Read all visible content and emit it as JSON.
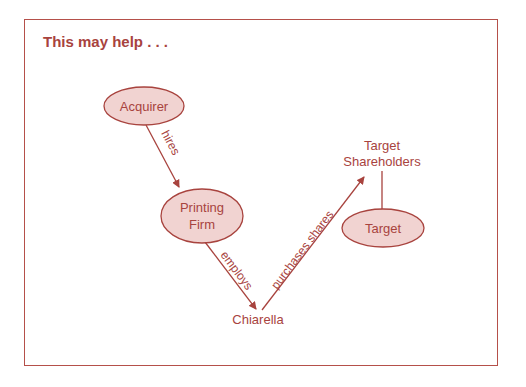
{
  "title": "This may help . . .",
  "colors": {
    "stroke": "#a8433e",
    "fill": "#f1d3d1",
    "frame": "#b5504a"
  },
  "nodes": {
    "acquirer": "Acquirer",
    "printing_firm_line1": "Printing",
    "printing_firm_line2": "Firm",
    "chiarella": "Chiarella",
    "target_shareholders_line1": "Target",
    "target_shareholders_line2": "Shareholders",
    "target": "Target"
  },
  "edges": {
    "hires": "hires",
    "employs": "employs",
    "purchases_shares": "purchases shares"
  }
}
